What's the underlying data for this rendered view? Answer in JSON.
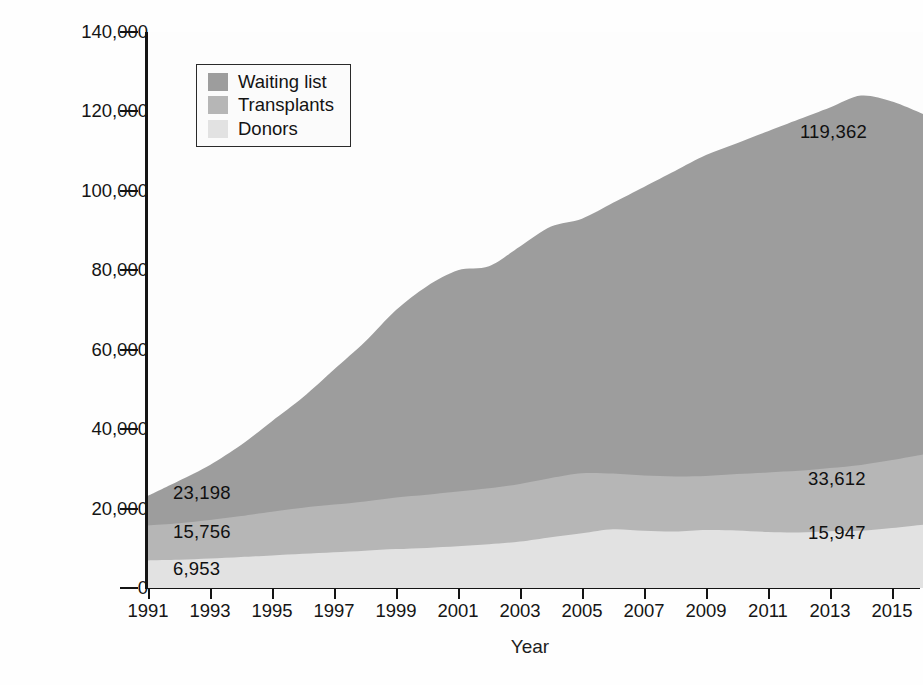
{
  "chart_data": {
    "type": "area",
    "stacked": true,
    "title": "",
    "xlabel": "Year",
    "ylabel": "Number of people",
    "xlim": [
      1991,
      2016
    ],
    "ylim": [
      0,
      140000
    ],
    "grid": false,
    "legend_position": "top-left inside plot",
    "x": [
      1991,
      1992,
      1993,
      1994,
      1995,
      1996,
      1997,
      1998,
      1999,
      2000,
      2001,
      2002,
      2003,
      2004,
      2005,
      2006,
      2007,
      2008,
      2009,
      2010,
      2011,
      2012,
      2013,
      2014,
      2015,
      2016
    ],
    "xticks": [
      1991,
      1993,
      1995,
      1997,
      1999,
      2001,
      2003,
      2005,
      2007,
      2009,
      2011,
      2013,
      2015
    ],
    "xtick_labels": [
      "1991",
      "1993",
      "1995",
      "1997",
      "1999",
      "2001",
      "2003",
      "2005",
      "2007",
      "2009",
      "2011",
      "2013",
      "2015"
    ],
    "yticks": [
      0,
      20000,
      40000,
      60000,
      80000,
      100000,
      120000,
      140000
    ],
    "ytick_labels": [
      "0",
      "20,000",
      "40,000",
      "60,000",
      "80,000",
      "100,000",
      "120,000",
      "140,000"
    ],
    "series": [
      {
        "name": "Waiting list",
        "color": "#9d9d9d",
        "note": "top band; values are cumulative totals of the stack",
        "values": [
          23198,
          27000,
          31000,
          36000,
          42000,
          48000,
          55000,
          62000,
          70000,
          76000,
          80000,
          81000,
          86000,
          91000,
          93000,
          97000,
          101000,
          105000,
          109000,
          112000,
          115000,
          118000,
          121000,
          124000,
          122500,
          119362
        ]
      },
      {
        "name": "Transplants",
        "color": "#b6b6b6",
        "note": "middle band; values are cumulative (donors + transplants)",
        "values": [
          15756,
          16300,
          17100,
          18100,
          19200,
          20200,
          21000,
          21800,
          22800,
          23500,
          24300,
          25100,
          26200,
          27700,
          28900,
          28800,
          28300,
          28100,
          28200,
          28700,
          29100,
          29500,
          30200,
          31000,
          32200,
          33612
        ]
      },
      {
        "name": "Donors",
        "color": "#e2e2e2",
        "note": "bottom band; values are the donor counts themselves",
        "values": [
          6953,
          7100,
          7400,
          7800,
          8200,
          8600,
          9000,
          9400,
          9800,
          10100,
          10500,
          11000,
          11700,
          12800,
          13800,
          14800,
          14400,
          14200,
          14600,
          14500,
          14100,
          14000,
          14300,
          14400,
          15100,
          15947
        ]
      }
    ],
    "callouts": [
      {
        "text": "23,198",
        "series": "Waiting list",
        "year": 1991,
        "side": "left"
      },
      {
        "text": "15,756",
        "series": "Transplants",
        "year": 1991,
        "side": "left"
      },
      {
        "text": "6,953",
        "series": "Donors",
        "year": 1991,
        "side": "left"
      },
      {
        "text": "119,362",
        "series": "Waiting list",
        "year": 2016,
        "side": "right"
      },
      {
        "text": "33,612",
        "series": "Transplants",
        "year": 2016,
        "side": "right"
      },
      {
        "text": "15,947",
        "series": "Donors",
        "year": 2016,
        "side": "right"
      }
    ]
  },
  "axes": {
    "ylabel": "Number of people",
    "xlabel": "Year",
    "ytick_labels": [
      "140,000",
      "120,000",
      "100,000",
      "80,000",
      "60,000",
      "40,000",
      "20,000",
      "0"
    ],
    "xtick_labels": [
      "1991",
      "1993",
      "1995",
      "1997",
      "1999",
      "2001",
      "2003",
      "2005",
      "2007",
      "2009",
      "2011",
      "2013",
      "2015"
    ]
  },
  "legend": {
    "items": [
      {
        "label": "Waiting list",
        "color": "#9d9d9d"
      },
      {
        "label": "Transplants",
        "color": "#b6b6b6"
      },
      {
        "label": "Donors",
        "color": "#e2e2e2"
      }
    ]
  },
  "callouts": {
    "left_top": "23,198",
    "left_mid": "15,756",
    "left_bottom": "6,953",
    "right_top": "119,362",
    "right_mid": "33,612",
    "right_bottom": "15,947"
  }
}
